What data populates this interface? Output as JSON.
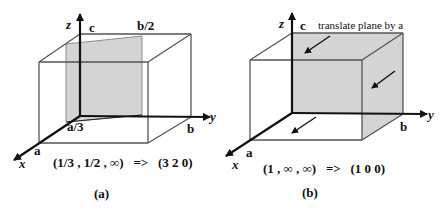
{
  "panels": [
    {
      "id": "a",
      "caption": "(a)",
      "formula": "(1/3 , 1/2 , ∞)   =>   (3 2 0)",
      "axes": {
        "x": "x",
        "y": "y",
        "z": "z"
      },
      "vector_labels": {
        "a": "a",
        "b": "b",
        "c": "c"
      },
      "intercept_labels": {
        "x": "a/3",
        "y": "b/2"
      },
      "plane_intercepts": [
        "1/3",
        "1/2",
        "∞"
      ],
      "miller_indices": "(3 2 0)"
    },
    {
      "id": "b",
      "caption": "(b)",
      "formula": "(1 , ∞ , ∞)   =>   (1 0 0)",
      "axes": {
        "x": "x",
        "y": "y",
        "z": "z"
      },
      "vector_labels": {
        "a": "a",
        "b": "b",
        "c": "c"
      },
      "annotation": "translate plane by a",
      "plane_intercepts": [
        "1",
        "∞",
        "∞"
      ],
      "miller_indices": "(1 0 0)"
    }
  ],
  "colors": {
    "edge": "#555555",
    "axis": "#111111",
    "plane_fill": "#d4d4d4"
  }
}
